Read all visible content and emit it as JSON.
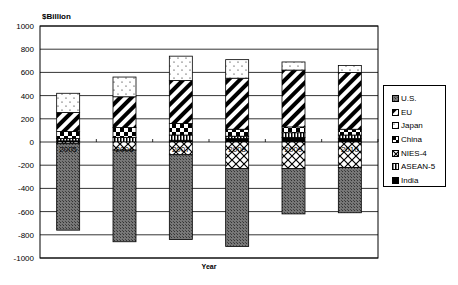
{
  "chart_data": {
    "type": "bar",
    "stacked": true,
    "title": "",
    "xlabel": "Year",
    "ylabel": "$Billion",
    "ylim": [
      -1000,
      1000
    ],
    "yticks": [
      1000,
      800,
      600,
      400,
      200,
      0,
      -200,
      -400,
      -600,
      -800,
      -1000
    ],
    "grid": true,
    "legend_position": "right",
    "categories": [
      "2005",
      "2006",
      "2007",
      "2008",
      "2009",
      "2010"
    ],
    "series": [
      {
        "name": "U.S.",
        "pattern": "dark-crosshatch",
        "values": [
          -745,
          -790,
          -730,
          -670,
          -390,
          -390
        ]
      },
      {
        "name": "EU",
        "pattern": "diagonal-stripes",
        "values": [
          165,
          265,
          370,
          440,
          490,
          490
        ]
      },
      {
        "name": "Japan",
        "pattern": "dots",
        "values": [
          165,
          170,
          210,
          160,
          70,
          60
        ]
      },
      {
        "name": "China",
        "pattern": "checkerboard",
        "values": [
          60,
          85,
          100,
          60,
          50,
          50
        ]
      },
      {
        "name": "NIES-4",
        "pattern": "lattice",
        "values": [
          -15,
          -70,
          -110,
          -230,
          -230,
          -220
        ]
      },
      {
        "name": "ASEAN-5",
        "pattern": "vertical-lines",
        "values": [
          20,
          40,
          45,
          20,
          40,
          30
        ]
      },
      {
        "name": "India",
        "pattern": "solid-black",
        "values": [
          10,
          0,
          15,
          30,
          40,
          30
        ]
      }
    ]
  },
  "legend": {
    "items": [
      "U.S.",
      "EU",
      "Japan",
      "China",
      "NIES-4",
      "ASEAN-5",
      "India"
    ]
  },
  "axis": {
    "y_unit_label": "$Billion",
    "x_title": "Year"
  }
}
